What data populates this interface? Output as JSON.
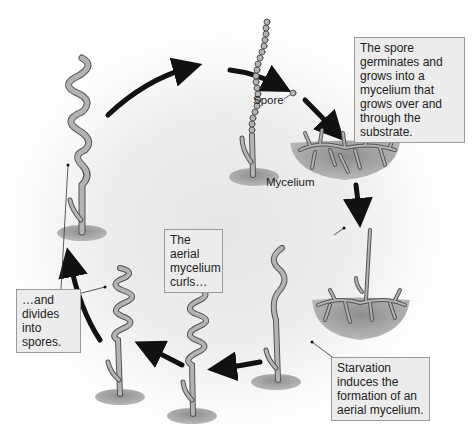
{
  "diagram": {
    "colors": {
      "background": "#ececec",
      "hypha_fill": "#b3b3b3",
      "hypha_stroke": "#555555",
      "substrate": "#9a9a9a",
      "arrow": "#111111",
      "callout_bg": "#ececec",
      "callout_border": "#9a9a9a"
    },
    "labels": {
      "spore": "Spore",
      "mycelium": "Mycelium"
    },
    "callouts": {
      "germination": "The spore germinates and grows into a mycelium that grows over and through the substrate.",
      "starvation": "Starvation induces the formation of an aerial mycelium.",
      "curls": "The aerial mycelium curls…",
      "divides": "…and divides into spores."
    },
    "stages": [
      {
        "id": "spore-chain",
        "description": "Chain of spores on aerial hypha"
      },
      {
        "id": "free-spore",
        "description": "Released spore"
      },
      {
        "id": "substrate-mycelium",
        "description": "Branching mycelium in substrate"
      },
      {
        "id": "aerial-hypha-emerging",
        "description": "Aerial hypha growing from mycelium"
      },
      {
        "id": "aerial-hypha-wavy",
        "description": "Wavy aerial hypha"
      },
      {
        "id": "aerial-hypha-coiled-1",
        "description": "Curled aerial mycelium"
      },
      {
        "id": "aerial-hypha-coiled-2",
        "description": "Tightly coiled aerial mycelium"
      },
      {
        "id": "aerial-hypha-segmented",
        "description": "Aerial hypha dividing into spores"
      }
    ]
  }
}
